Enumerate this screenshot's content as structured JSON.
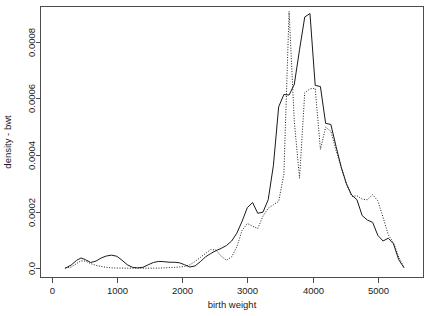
{
  "chart_data": {
    "type": "line",
    "title": "",
    "xlabel": "birth weight",
    "ylabel": "density - bwt",
    "xlim": [
      -170,
      5700
    ],
    "ylim": [
      -3.3e-05,
      0.000925
    ],
    "grid": false,
    "legend": "none",
    "xticks": [
      0,
      1000,
      2000,
      3000,
      4000,
      5000
    ],
    "xtick_labels": [
      "0",
      "1000",
      "2000",
      "3000",
      "4000",
      "5000"
    ],
    "yticks": [
      0.0,
      0.0002,
      0.0004,
      0.0006,
      0.0008
    ],
    "ytick_labels": [
      "0.0",
      "0.0002",
      "0.0004",
      "0.0006",
      "0.0008"
    ],
    "series": [
      {
        "name": "solid-curve",
        "style": "solid",
        "color": "#1a1a1a",
        "x": [
          210,
          300,
          380,
          450,
          520,
          600,
          680,
          760,
          840,
          920,
          1000,
          1080,
          1160,
          1240,
          1320,
          1400,
          1480,
          1560,
          1640,
          1720,
          1800,
          1880,
          1960,
          2040,
          2120,
          2200,
          2280,
          2360,
          2440,
          2520,
          2600,
          2680,
          2760,
          2840,
          2920,
          3000,
          3080,
          3160,
          3240,
          3320,
          3400,
          3480,
          3560,
          3640,
          3720,
          3800,
          3880,
          3960,
          4040,
          4120,
          4200,
          4280,
          4360,
          4440,
          4520,
          4600,
          4680,
          4760,
          4840,
          4920,
          5000,
          5080,
          5160,
          5240,
          5320,
          5400
        ],
        "y": [
          0.0,
          1.1e-05,
          2.7e-05,
          3.6e-05,
          3e-05,
          2e-05,
          2.5e-05,
          3.6e-05,
          4.3e-05,
          4.6e-05,
          4.2e-05,
          2.8e-05,
          1.2e-05,
          3e-06,
          1e-06,
          3e-06,
          1.2e-05,
          2e-05,
          2.4e-05,
          2.3e-05,
          2.1e-05,
          2.1e-05,
          1.9e-05,
          1.2e-05,
          4e-06,
          8e-06,
          2.3e-05,
          4e-05,
          5.2e-05,
          6.2e-05,
          7e-05,
          8e-05,
          9.6e-05,
          0.000124,
          0.000166,
          0.000214,
          0.000232,
          0.000194,
          0.000198,
          0.000242,
          0.000364,
          0.00057,
          0.000614,
          0.000612,
          0.00065,
          0.000772,
          0.000888,
          0.0009,
          0.000646,
          0.000642,
          0.000512,
          0.000508,
          0.00043,
          0.000356,
          0.000298,
          0.000258,
          0.000242,
          0.000186,
          0.00017,
          0.000162,
          0.000116,
          9.6e-05,
          0.000106,
          8.6e-05,
          3e-05,
          2e-06
        ]
      },
      {
        "name": "dotted-curve",
        "style": "dotted",
        "color": "#1a1a1a",
        "x": [
          210,
          300,
          380,
          450,
          520,
          600,
          680,
          760,
          840,
          920,
          1000,
          1080,
          1160,
          1240,
          1320,
          1400,
          1480,
          1560,
          1640,
          1720,
          1800,
          1880,
          1960,
          2040,
          2120,
          2200,
          2280,
          2360,
          2440,
          2520,
          2600,
          2680,
          2760,
          2840,
          2920,
          3000,
          3080,
          3160,
          3240,
          3320,
          3400,
          3480,
          3560,
          3640,
          3720,
          3800,
          3880,
          3960,
          4040,
          4120,
          4200,
          4280,
          4360,
          4440,
          4520,
          4600,
          4680,
          4760,
          4840,
          4920,
          5000,
          5080,
          5160,
          5240,
          5320,
          5400
        ],
        "y": [
          0.0,
          4e-06,
          1.6e-05,
          2.6e-05,
          2.5e-05,
          1.6e-05,
          1e-05,
          6e-06,
          3e-06,
          1e-06,
          5e-07,
          2e-07,
          0.0,
          0.0,
          0.0,
          0.0,
          0.0,
          0.0,
          0.0,
          1e-06,
          2e-06,
          3e-06,
          4e-06,
          6e-06,
          1.2e-05,
          2.4e-05,
          3.8e-05,
          5.2e-05,
          6.6e-05,
          6.4e-05,
          4.2e-05,
          2.8e-05,
          4e-05,
          7.6e-05,
          0.000134,
          0.000158,
          0.000148,
          0.00014,
          0.000184,
          0.000212,
          0.000224,
          0.000236,
          0.000332,
          0.000908,
          0.000518,
          0.000318,
          0.00062,
          0.000634,
          0.000636,
          0.00042,
          0.000498,
          0.000484,
          0.000416,
          0.000356,
          0.000296,
          0.000254,
          0.000256,
          0.000244,
          0.000242,
          0.00026,
          0.000238,
          0.00018,
          0.000118,
          9e-05,
          4e-05,
          2e-06
        ]
      }
    ]
  }
}
